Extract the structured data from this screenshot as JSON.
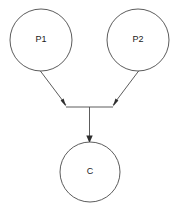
{
  "diagram": {
    "type": "causal-graph",
    "background_color": "#ffffff",
    "stroke_color": "#4a4a4a",
    "label_color": "#1a1a1a",
    "arrow_color": "#2e2e2e",
    "nodes": [
      {
        "id": "p1",
        "label": "P1",
        "shape": "circle",
        "cx": 41,
        "cy": 40,
        "r": 31,
        "label_x": 41,
        "label_y": 40
      },
      {
        "id": "p2",
        "label": "P2",
        "shape": "circle",
        "cx": 138,
        "cy": 40,
        "r": 31,
        "label_x": 138,
        "label_y": 40
      },
      {
        "id": "c",
        "label": "C",
        "shape": "circle",
        "cx": 90,
        "cy": 172,
        "r": 30,
        "label_x": 90,
        "label_y": 172
      }
    ],
    "edges": [
      {
        "id": "edge-p1-junction",
        "from": "p1",
        "to": "junction-left",
        "path": "M 38.5,68.5 L 66,105",
        "arrow_points": "66,106.5 60.6,100.6 63.6,98.6",
        "arrow_tip_x": 66,
        "arrow_tip_y": 106.5
      },
      {
        "id": "edge-p2-junction",
        "from": "p2",
        "to": "junction-right",
        "path": "M 140.5,68.5 L 113,105",
        "arrow_points": "113,106.5 115.4,98.6 118.4,100.6",
        "arrow_tip_x": 113,
        "arrow_tip_y": 106.5
      },
      {
        "id": "edge-junction-bar",
        "from": "junction-left",
        "to": "junction-right",
        "path": "M 66,107 L 113,107"
      },
      {
        "id": "edge-junction-c",
        "from": "junction",
        "to": "c",
        "path": "M 89.5,107 L 89.5,139",
        "arrow_points": "89.5,143 86.3,135.5 92.7,135.5",
        "arrow_tip_x": 89.5,
        "arrow_tip_y": 143
      }
    ]
  }
}
